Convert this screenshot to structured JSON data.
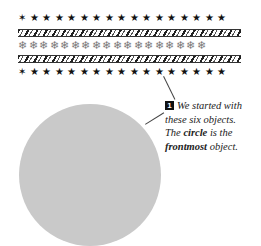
{
  "rows": {
    "stars_top": "✶★★★★★★★★★★★★★★★★",
    "snowflakes": "❄❄❄❄❄❄❄❄❄❄❄❄❄❄❄❄❄❄",
    "stars_bottom": "✶★★★★★★★★★★★★★★★★"
  },
  "callout": {
    "number": "1",
    "line1": "We started with",
    "line2": "these six objects.",
    "line3_pre": "The ",
    "line3_bold": "circle",
    "line3_post": " is the",
    "line4_bold": "frontmost",
    "line4_post": " object."
  },
  "colors": {
    "circle": "#c9c9c9",
    "stars": "#111111",
    "snowflakes": "#777777"
  }
}
